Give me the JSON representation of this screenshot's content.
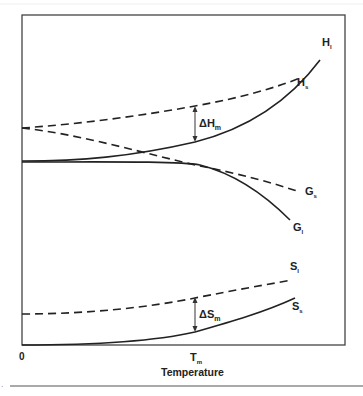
{
  "diagram": {
    "type": "thermodynamic-functions-vs-temperature",
    "x_axis": {
      "label": "Temperature",
      "ticks": [
        {
          "label": "0",
          "position": "origin"
        },
        {
          "label": "T",
          "sub": "m",
          "position": "melting-point"
        }
      ]
    },
    "curves": [
      {
        "id": "H_l",
        "label": "H",
        "sub": "l",
        "style": "solid",
        "description": "enthalpy of liquid"
      },
      {
        "id": "H_s",
        "label": "H",
        "sub": "s",
        "style": "dashed",
        "description": "enthalpy of solid"
      },
      {
        "id": "G_s",
        "label": "G",
        "sub": "s",
        "style": "dashed",
        "description": "free energy of solid"
      },
      {
        "id": "G_l",
        "label": "G",
        "sub": "l",
        "style": "solid",
        "description": "free energy of liquid"
      },
      {
        "id": "S_l",
        "label": "S",
        "sub": "l",
        "style": "solid",
        "description": "entropy of liquid"
      },
      {
        "id": "S_s",
        "label": "S",
        "sub": "s",
        "style": "dashed",
        "description": "entropy of solid"
      }
    ],
    "annotations": [
      {
        "id": "dH",
        "symbol": "ΔH",
        "sub": "m",
        "description": "enthalpy of melting at Tm"
      },
      {
        "id": "dS",
        "symbol": "ΔS",
        "sub": "m",
        "description": "entropy of melting at Tm"
      }
    ],
    "footnote_marker": "."
  }
}
